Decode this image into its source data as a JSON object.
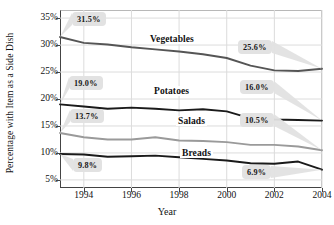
{
  "chart_data": {
    "type": "line",
    "title": "",
    "xlabel": "Year",
    "ylabel": "Percentage with Item as a Side Dish",
    "x": [
      1993,
      1994,
      1995,
      1996,
      1997,
      1998,
      1999,
      2000,
      2001,
      2002,
      2003,
      2004
    ],
    "xtick_labels": [
      "1994",
      "1996",
      "1998",
      "2000",
      "2002",
      "2004"
    ],
    "xticks": [
      1994,
      1996,
      1998,
      2000,
      2002,
      2004
    ],
    "xlim": [
      1993,
      2004
    ],
    "ylim": [
      3.5,
      36.5
    ],
    "yticks": [
      5,
      10,
      15,
      20,
      25,
      30,
      35
    ],
    "ytick_labels": [
      "5%",
      "10%",
      "15%",
      "20%",
      "25%",
      "30%",
      "35%"
    ],
    "grid": true,
    "legend": "inline-labels",
    "series": [
      {
        "name": "Vegetables",
        "color": "#555555",
        "values": [
          31.5,
          30.4,
          30.1,
          29.6,
          29.2,
          28.8,
          28.3,
          27.6,
          26.2,
          25.3,
          25.2,
          25.6
        ],
        "start_label": "31.5%",
        "end_label": "25.6%"
      },
      {
        "name": "Potatoes",
        "color": "#1a1a1a",
        "values": [
          19.0,
          18.6,
          18.2,
          18.4,
          18.2,
          17.9,
          18.1,
          17.7,
          16.4,
          16.2,
          16.1,
          16.0
        ],
        "start_label": "19.0%",
        "end_label": "16.0%"
      },
      {
        "name": "Salads",
        "color": "#9a9a9a",
        "values": [
          13.7,
          12.9,
          12.5,
          12.5,
          12.9,
          12.3,
          12.2,
          12.0,
          11.5,
          11.5,
          11.2,
          10.5
        ],
        "start_label": "13.7%",
        "end_label": "10.5%"
      },
      {
        "name": "Breads",
        "color": "#1a1a1a",
        "values": [
          9.8,
          9.7,
          9.3,
          9.4,
          9.5,
          9.2,
          8.9,
          8.6,
          8.1,
          8.0,
          8.4,
          6.9
        ],
        "start_label": "9.8%",
        "end_label": "6.9%"
      }
    ],
    "callouts": [
      {
        "text": "31.5%",
        "series": "Vegetables",
        "side": "start"
      },
      {
        "text": "25.6%",
        "series": "Vegetables",
        "side": "end"
      },
      {
        "text": "19.0%",
        "series": "Potatoes",
        "side": "start"
      },
      {
        "text": "16.0%",
        "series": "Potatoes",
        "side": "end"
      },
      {
        "text": "13.7%",
        "series": "Salads",
        "side": "start"
      },
      {
        "text": "10.5%",
        "series": "Salads",
        "side": "end"
      },
      {
        "text": "9.8%",
        "series": "Breads",
        "side": "start"
      },
      {
        "text": "6.9%",
        "series": "Breads",
        "side": "end"
      }
    ],
    "series_labels": [
      {
        "text": "Vegetables"
      },
      {
        "text": "Potatoes"
      },
      {
        "text": "Salads"
      },
      {
        "text": "Breads"
      }
    ]
  }
}
